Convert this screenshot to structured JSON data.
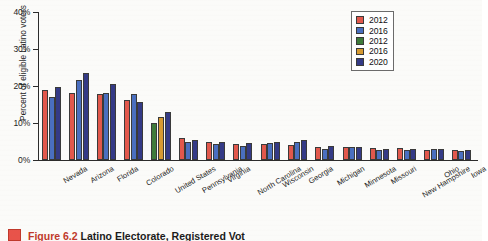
{
  "chart_data": {
    "type": "bar",
    "title": "",
    "xlabel": "",
    "ylabel": "Percent of eligible Latino voters",
    "ylim": [
      0,
      40
    ],
    "ytick_labels": [
      "0%",
      "10%",
      "20%",
      "30%",
      "40%"
    ],
    "ytick_values": [
      0,
      10,
      20,
      30,
      40
    ],
    "grid": false,
    "legend_position": "top-right",
    "legend": [
      {
        "label": "2012",
        "color": "#e2584c"
      },
      {
        "label": "2016",
        "color": "#4a6fc0"
      },
      {
        "label": "2012",
        "color": "#3e7a3a"
      },
      {
        "label": "2016",
        "color": "#d79a31"
      },
      {
        "label": "2020",
        "color": "#343a86"
      }
    ],
    "categories": [
      "Nevada",
      "Arizona",
      "Florida",
      "Colorado",
      "United States",
      "Pennsylvania",
      "Virginia",
      "North Carolina",
      "Wisconsin",
      "Georgia",
      "Michigan",
      "Minnesota",
      "Missouri",
      "New Hampshire",
      "Ohio",
      "Iowa"
    ],
    "series": [
      {
        "name": "2012",
        "color": "#e2584c",
        "values": [
          18.9,
          18.0,
          17.8,
          16.3,
          null,
          6.0,
          5.0,
          4.4,
          4.2,
          4.0,
          3.5,
          3.4,
          3.3,
          3.2,
          2.8,
          2.6
        ]
      },
      {
        "name": "2016",
        "color": "#4a6fc0",
        "values": [
          17.1,
          21.5,
          18.1,
          17.8,
          null,
          4.8,
          4.3,
          3.9,
          4.6,
          4.8,
          3.1,
          3.4,
          2.7,
          2.6,
          2.9,
          2.4
        ]
      },
      {
        "name": "2012",
        "color": "#3e7a3a",
        "values": [
          null,
          null,
          null,
          null,
          10.0,
          null,
          null,
          null,
          null,
          null,
          null,
          null,
          null,
          null,
          null,
          null
        ]
      },
      {
        "name": "2016",
        "color": "#d79a31",
        "values": [
          null,
          null,
          null,
          null,
          11.5,
          null,
          null,
          null,
          null,
          null,
          null,
          null,
          null,
          null,
          null,
          null
        ]
      },
      {
        "name": "2020",
        "color": "#343a86",
        "values": [
          19.7,
          23.6,
          20.5,
          15.6,
          13.0,
          5.3,
          4.8,
          4.6,
          5.0,
          5.3,
          3.7,
          3.6,
          3.1,
          3.0,
          3.1,
          2.8
        ]
      }
    ]
  },
  "caption": {
    "figure_number": "Figure 6.2",
    "rest": " Latino Electorate, Registered Vot"
  }
}
